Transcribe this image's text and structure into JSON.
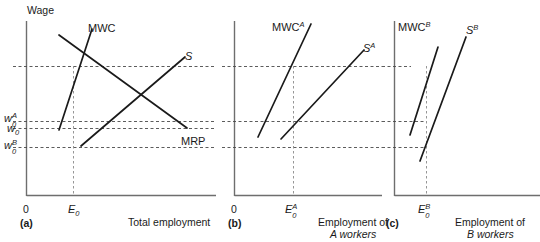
{
  "figure": {
    "title": "",
    "panels": [
      {
        "id": "a",
        "tag": "(a)",
        "y_axis_label": "Wage",
        "x_axis_label": "Total employment",
        "origin_label": "0",
        "x_tick": {
          "base": "E",
          "sub": "0",
          "sup": ""
        },
        "y_ticks": [
          {
            "base": "w",
            "sub": "0",
            "sup": "A"
          },
          {
            "base": "w",
            "sub": "0",
            "sup": ""
          },
          {
            "base": "w",
            "sub": "0",
            "sup": "B"
          }
        ],
        "curves": [
          {
            "name": "MWC",
            "base": "MWC",
            "sup": ""
          },
          {
            "name": "S",
            "base": "S",
            "sup": ""
          },
          {
            "name": "MRP",
            "base": "MRP",
            "sup": ""
          }
        ]
      },
      {
        "id": "b",
        "tag": "(b)",
        "y_axis_label": "",
        "x_axis_label_line1": "Employment of",
        "x_axis_label_line2": "A workers",
        "origin_label": "0",
        "x_tick": {
          "base": "E",
          "sub": "0",
          "sup": "A"
        },
        "curves": [
          {
            "name": "MWC-A",
            "base": "MWC",
            "sup": "A"
          },
          {
            "name": "S-A",
            "base": "S",
            "sup": "A"
          }
        ]
      },
      {
        "id": "c",
        "tag": "(c)",
        "y_axis_label": "",
        "x_axis_label_line1": "Employment of",
        "x_axis_label_line2": "B workers",
        "origin_label": "",
        "x_tick": {
          "base": "E",
          "sub": "0",
          "sup": "B"
        },
        "curves": [
          {
            "name": "MWC-B",
            "base": "MWC",
            "sup": "B"
          },
          {
            "name": "S-B",
            "base": "S",
            "sup": "B"
          }
        ]
      }
    ],
    "colors": {
      "curve": "#1a1a1a",
      "axis": "#6e6e6e",
      "guide": "#4a4a4a",
      "background": "#ffffff"
    }
  }
}
